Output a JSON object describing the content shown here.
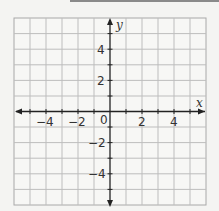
{
  "graph": {
    "x_axis_label": "x",
    "y_axis_label": "y",
    "origin_label": "0",
    "x_tick_labels": [
      "−4",
      "−2",
      "2",
      "4"
    ],
    "y_tick_labels": [
      "4",
      "2",
      "−2",
      "−4"
    ],
    "x_range": [
      -6,
      6
    ],
    "y_range": [
      -6,
      6
    ],
    "grid_color": "#b9b9b9",
    "axis_color": "#222222"
  }
}
